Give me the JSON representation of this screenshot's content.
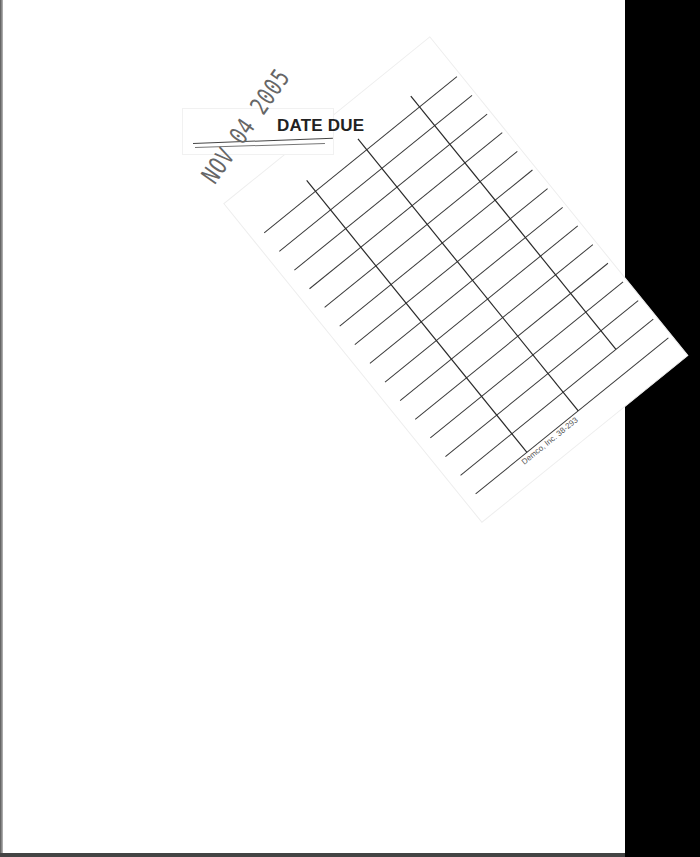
{
  "document": {
    "type": "library book scan with date due slip",
    "card": {
      "title": "DATE DUE",
      "rows": 15,
      "columns": 3,
      "stamped_date": "NOV 04 2005",
      "printer_footer": "Demco, Inc. 38-293"
    },
    "colors": {
      "page": "#ffffff",
      "band": "#000000",
      "grid_line": "#444444",
      "stamp_ink": "#666666"
    }
  }
}
